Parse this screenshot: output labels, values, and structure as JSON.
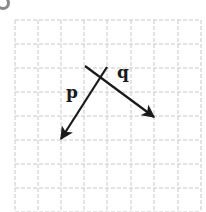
{
  "figure": {
    "marker": "circle-bullet",
    "grid": {
      "columns": 8,
      "rows": 8,
      "x_lines": [
        15,
        38,
        61,
        84,
        107,
        131,
        154,
        178,
        201
      ],
      "y_lines": [
        20,
        44,
        68,
        92,
        116,
        140,
        164,
        188,
        212
      ],
      "line_color": "#c8c8c8",
      "line_style": "dashed"
    },
    "vectors": [
      {
        "name": "p",
        "label": "p",
        "from": [
          107,
          67
        ],
        "to": [
          61,
          139
        ],
        "label_pos": [
          66,
          84
        ]
      },
      {
        "name": "q",
        "label": "q",
        "from": [
          85,
          66
        ],
        "to": [
          154,
          117
        ],
        "label_pos": [
          117,
          64
        ]
      }
    ],
    "arrow_color": "#1a1a1a"
  }
}
